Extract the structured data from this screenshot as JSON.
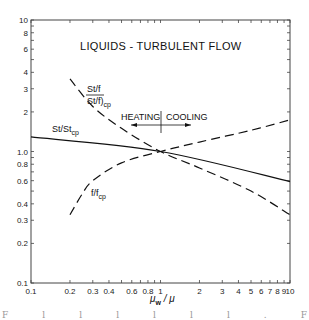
{
  "chart_data": {
    "type": "line",
    "title": "LIQUIDS - TURBULENT FLOW",
    "xlabel": "μw / μ",
    "ylabel": "",
    "xscale": "log",
    "yscale": "log",
    "xlim": [
      0.1,
      10
    ],
    "ylim": [
      0.1,
      10
    ],
    "grid": false,
    "x_tick_labels": [
      "0.1",
      "0.2",
      "0.3",
      "0.4",
      "0.6",
      "0.8",
      "1",
      "2",
      "3",
      "4",
      "5",
      "6",
      "7",
      "8",
      "9",
      "10"
    ],
    "x_tick_values": [
      0.1,
      0.2,
      0.3,
      0.4,
      0.6,
      0.8,
      1,
      2,
      3,
      4,
      5,
      6,
      7,
      8,
      9,
      10
    ],
    "y_tick_labels": [
      "0.1",
      "0.2",
      "0.3",
      "0.4",
      "0.6",
      "0.8",
      "1.0",
      "2",
      "3",
      "4",
      "6",
      "8",
      "10"
    ],
    "y_tick_values": [
      0.1,
      0.2,
      0.3,
      0.4,
      0.6,
      0.8,
      1.0,
      2,
      3,
      4,
      6,
      8,
      10
    ],
    "series": [
      {
        "name": "St/Stcp",
        "style": "solid",
        "x": [
          0.1,
          1,
          10
        ],
        "values": [
          1.29,
          1.0,
          0.59
        ]
      },
      {
        "name": "(St/f)/(St/f)cp",
        "style": "dashed",
        "x": [
          0.2,
          0.3,
          0.5,
          1,
          2,
          5,
          10
        ],
        "values": [
          3.56,
          2.2,
          1.5,
          1.0,
          0.75,
          0.5,
          0.33
        ]
      },
      {
        "name": "f/fcp",
        "style": "dashed",
        "x": [
          0.2,
          0.25,
          0.3,
          0.5,
          1,
          2,
          5,
          10
        ],
        "values": [
          0.33,
          0.48,
          0.6,
          0.82,
          1.0,
          1.18,
          1.45,
          1.74
        ]
      }
    ],
    "annotations": [
      {
        "text": "HEATING",
        "arrow": "left"
      },
      {
        "text": "COOLING",
        "arrow": "right"
      }
    ]
  },
  "labels": {
    "title": "LIQUIDS - TURBULENT FLOW",
    "st_stcp": "St/St",
    "st_stcp_sub": "cp",
    "stf_num": "St/f",
    "stf_den": "St/f)",
    "stf_den_sub": "cp",
    "f_fcp": "f/f",
    "f_fcp_sub": "cp",
    "heating": "HEATING",
    "cooling": "COOLING",
    "xlabel_main": "μ",
    "xlabel_sub": "w",
    "xlabel_rest": " / μ"
  }
}
